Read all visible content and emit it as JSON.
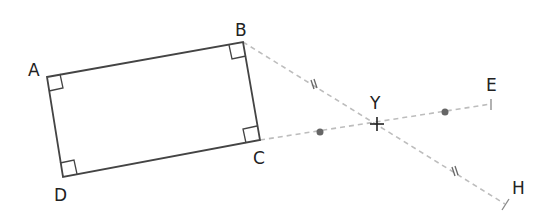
{
  "diagram": {
    "points": {
      "A": {
        "label": "A",
        "x": 47,
        "y": 77,
        "lx": 28,
        "ly": 76
      },
      "B": {
        "label": "B",
        "x": 243,
        "y": 42,
        "lx": 235,
        "ly": 36
      },
      "C": {
        "label": "C",
        "x": 260,
        "y": 140,
        "lx": 253,
        "ly": 164
      },
      "D": {
        "label": "D",
        "x": 63,
        "y": 177,
        "lx": 54,
        "ly": 201
      },
      "Y": {
        "label": "Y",
        "x": 377,
        "y": 124,
        "lx": 370,
        "ly": 109
      },
      "E": {
        "label": "E",
        "x": 491,
        "y": 104,
        "lx": 486,
        "ly": 91
      },
      "H": {
        "label": "H",
        "x": 505,
        "y": 204,
        "lx": 512,
        "ly": 194
      }
    },
    "segments": [
      {
        "from": "B",
        "to": "H",
        "style": "dashed",
        "marks": "double-tick"
      },
      {
        "from": "C",
        "to": "E",
        "style": "dashed",
        "marks": "dot"
      }
    ],
    "colors": {
      "shape": "#444444",
      "construction": "#bdbdbd",
      "mark": "#666666"
    }
  }
}
